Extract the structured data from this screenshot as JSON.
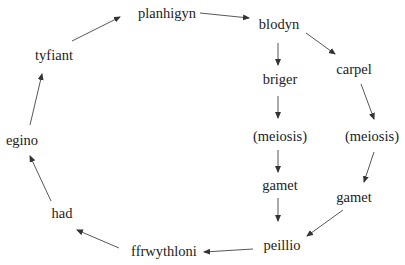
{
  "diagram": {
    "type": "cycle-flowchart",
    "nodes": [
      {
        "id": "planhigyn",
        "label": "planhigyn",
        "x": 167,
        "y": 13
      },
      {
        "id": "blodyn",
        "label": "blodyn",
        "x": 279,
        "y": 24
      },
      {
        "id": "carpel",
        "label": "carpel",
        "x": 354,
        "y": 69
      },
      {
        "id": "briger",
        "label": "briger",
        "x": 280,
        "y": 79
      },
      {
        "id": "meiosis1",
        "label": "(meiosis)",
        "x": 280,
        "y": 136
      },
      {
        "id": "meiosis2",
        "label": "(meiosis)",
        "x": 372,
        "y": 136
      },
      {
        "id": "gamet1",
        "label": "gamet",
        "x": 280,
        "y": 185
      },
      {
        "id": "gamet2",
        "label": "gamet",
        "x": 354,
        "y": 197
      },
      {
        "id": "peillio",
        "label": "peillio",
        "x": 282,
        "y": 245
      },
      {
        "id": "ffrwythloni",
        "label": "ffrwythloni",
        "x": 164,
        "y": 251
      },
      {
        "id": "had",
        "label": "had",
        "x": 62,
        "y": 213
      },
      {
        "id": "egino",
        "label": "egino",
        "x": 22,
        "y": 140
      },
      {
        "id": "tyfiant",
        "label": "tyfiant",
        "x": 54,
        "y": 55
      }
    ],
    "edges": [
      {
        "from": "tyfiant",
        "to": "planhigyn",
        "x1": 72,
        "y1": 41,
        "x2": 120,
        "y2": 17
      },
      {
        "from": "planhigyn",
        "to": "blodyn",
        "x1": 200,
        "y1": 13,
        "x2": 249,
        "y2": 18
      },
      {
        "from": "blodyn",
        "to": "briger",
        "x1": 278,
        "y1": 43,
        "x2": 278,
        "y2": 65
      },
      {
        "from": "blodyn",
        "to": "carpel",
        "x1": 306,
        "y1": 33,
        "x2": 335,
        "y2": 54
      },
      {
        "from": "briger",
        "to": "meiosis1",
        "x1": 278,
        "y1": 96,
        "x2": 278,
        "y2": 118
      },
      {
        "from": "carpel",
        "to": "meiosis2",
        "x1": 361,
        "y1": 84,
        "x2": 374,
        "y2": 119
      },
      {
        "from": "meiosis1",
        "to": "gamet1",
        "x1": 278,
        "y1": 150,
        "x2": 278,
        "y2": 172
      },
      {
        "from": "meiosis2",
        "to": "gamet2",
        "x1": 374,
        "y1": 152,
        "x2": 364,
        "y2": 182
      },
      {
        "from": "gamet1",
        "to": "peillio",
        "x1": 278,
        "y1": 198,
        "x2": 278,
        "y2": 221
      },
      {
        "from": "gamet2",
        "to": "peillio",
        "x1": 343,
        "y1": 210,
        "x2": 307,
        "y2": 236
      },
      {
        "from": "peillio",
        "to": "ffrwythloni",
        "x1": 253,
        "y1": 249,
        "x2": 204,
        "y2": 252
      },
      {
        "from": "ffrwythloni",
        "to": "had",
        "x1": 119,
        "y1": 248,
        "x2": 77,
        "y2": 230
      },
      {
        "from": "had",
        "to": "egino",
        "x1": 51,
        "y1": 201,
        "x2": 30,
        "y2": 156
      },
      {
        "from": "egino",
        "to": "tyfiant",
        "x1": 30,
        "y1": 125,
        "x2": 42,
        "y2": 74
      }
    ],
    "colors": {
      "line": "#444444",
      "text": "#222222",
      "background": "#ffffff"
    }
  }
}
